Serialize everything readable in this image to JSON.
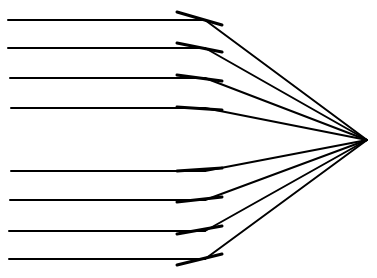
{
  "diagram": {
    "title": "",
    "colors": {
      "background": "#ffffff",
      "stroke": "#000000"
    },
    "focal_point": {
      "x": 367,
      "y": 140
    },
    "rays": [
      {
        "y": 20,
        "x_start": 8,
        "hit_x": 205
      },
      {
        "y": 48,
        "x_start": 8,
        "hit_x": 205
      },
      {
        "y": 78,
        "x_start": 10,
        "hit_x": 205
      },
      {
        "y": 108,
        "x_start": 11,
        "hit_x": 205
      },
      {
        "y": 171,
        "x_start": 11,
        "hit_x": 205
      },
      {
        "y": 200,
        "x_start": 10,
        "hit_x": 205
      },
      {
        "y": 231,
        "x_start": 9,
        "hit_x": 205
      },
      {
        "y": 259,
        "x_start": 9,
        "hit_x": 205
      }
    ],
    "mirror_facets": [
      {
        "x1": 177,
        "y1": 12,
        "x2": 222,
        "y2": 25
      },
      {
        "x1": 177,
        "y1": 43,
        "x2": 222,
        "y2": 52
      },
      {
        "x1": 177,
        "y1": 75,
        "x2": 222,
        "y2": 81
      },
      {
        "x1": 177,
        "y1": 107,
        "x2": 222,
        "y2": 110
      },
      {
        "x1": 177,
        "y1": 171,
        "x2": 222,
        "y2": 168
      },
      {
        "x1": 177,
        "y1": 202,
        "x2": 222,
        "y2": 197
      },
      {
        "x1": 177,
        "y1": 234,
        "x2": 222,
        "y2": 226
      },
      {
        "x1": 177,
        "y1": 265,
        "x2": 222,
        "y2": 254
      }
    ]
  }
}
